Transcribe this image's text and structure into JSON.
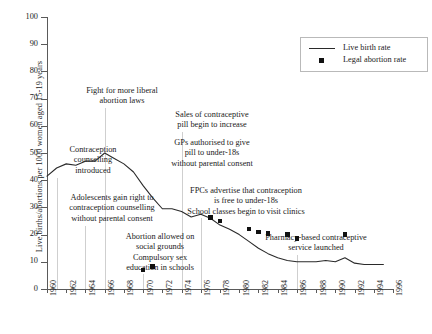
{
  "chart_data": {
    "type": "line",
    "title": "",
    "xlabel": "",
    "ylabel": "Live births/abortions per 1000 women aged 15-19 years",
    "xlim": [
      1960,
      1996
    ],
    "ylim": [
      0,
      100
    ],
    "grid": false,
    "legend_position": "top-right",
    "ytick_labels": [
      "0",
      "10",
      "20",
      "30",
      "40",
      "50",
      "60",
      "70",
      "80",
      "90",
      "100"
    ],
    "ytick_values": [
      0,
      10,
      20,
      30,
      40,
      50,
      60,
      70,
      80,
      90,
      100
    ],
    "xtick_labels": [
      "1960",
      "1962",
      "1964",
      "1966",
      "1968",
      "1970",
      "1972",
      "1974",
      "1976",
      "1978",
      "1980",
      "1982",
      "1984",
      "1986",
      "1988",
      "1990",
      "1992",
      "1994",
      "1996"
    ],
    "xtick_values": [
      1960,
      1962,
      1964,
      1966,
      1968,
      1970,
      1972,
      1974,
      1976,
      1978,
      1980,
      1982,
      1984,
      1986,
      1988,
      1990,
      1992,
      1994,
      1996
    ],
    "series": [
      {
        "name": "Live birth rate",
        "type": "line",
        "color": "#2a2a2a",
        "x": [
          1960,
          1961,
          1962,
          1963,
          1964,
          1965,
          1966,
          1967,
          1968,
          1969,
          1970,
          1971,
          1972,
          1973,
          1974,
          1975,
          1976,
          1977,
          1978,
          1979,
          1980,
          1981,
          1982,
          1983,
          1984,
          1985,
          1986,
          1987,
          1988,
          1989,
          1990,
          1991,
          1992,
          1993,
          1994,
          1995
        ],
        "values": [
          41.5,
          44.5,
          46.0,
          45.5,
          47.0,
          47.0,
          50.0,
          48.0,
          46.0,
          43.0,
          38.0,
          33.5,
          29.5,
          29.5,
          28.5,
          26.5,
          27.5,
          26.0,
          23.5,
          22.0,
          20.0,
          17.5,
          15.0,
          13.0,
          11.5,
          10.5,
          10.0,
          10.0,
          10.0,
          10.5,
          10.0,
          11.5,
          9.5,
          9.0,
          9.0,
          9.0
        ]
      },
      {
        "name": "Legal abortion rate",
        "type": "scatter",
        "color": "#111111",
        "marker": "square",
        "x": [
          1970,
          1971,
          1977,
          1978,
          1981,
          1982,
          1983,
          1985,
          1986,
          1991
        ],
        "values": [
          7.0,
          8.3,
          26.3,
          25.0,
          22.0,
          21.0,
          20.5,
          20.0,
          18.5,
          20.0
        ]
      }
    ],
    "annotations": [
      {
        "id": "contraception-counselling-introduced",
        "lines": [
          "Contraception",
          "counselling",
          "introduced"
        ],
        "year": 1961
      },
      {
        "id": "fight-for-more-liberal-abortion-laws",
        "lines": [
          "Fight for more liberal",
          "abortion laws"
        ],
        "year": 1966
      },
      {
        "id": "adolescents-gain-right",
        "lines": [
          "Adolescents gain right to",
          "contraception counselling",
          "without parental consent"
        ],
        "year": 1964
      },
      {
        "id": "sales-of-contraceptive-pill",
        "lines": [
          "Sales of contraceptive",
          "pill begin to increase"
        ],
        "year": 1974
      },
      {
        "id": "gps-authorised-to-give-pill",
        "lines": [
          "GPs authorised to give",
          "pill to under-18s",
          "without parental consent"
        ],
        "year": 1974
      },
      {
        "id": "abortion-allowed-on-social-grounds",
        "lines": [
          "Abortion allowed on",
          "social grounds",
          "Compulsory sex",
          "education in schools"
        ],
        "year": 1970
      },
      {
        "id": "fpcs-advertise-contraception",
        "lines": [
          "FPCs advertise that contraception",
          "is free to under-18s",
          "School classes begin to visit clinics"
        ],
        "year": 1976
      },
      {
        "id": "pharmacy-based-contraceptive-service",
        "lines": [
          "Pharmacy-based contraceptive",
          "service launched"
        ],
        "year": 1986
      }
    ],
    "legend": [
      {
        "label": "Live birth rate",
        "marker": "line"
      },
      {
        "label": "Legal abortion rate",
        "marker": "square"
      }
    ]
  }
}
